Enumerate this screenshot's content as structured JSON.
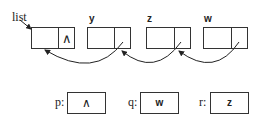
{
  "diagram": {
    "type": "linked-list",
    "head_label": "list",
    "nodes": [
      {
        "label": "list",
        "data": "",
        "next": "∧"
      },
      {
        "label": "y",
        "data": "",
        "next": "→list"
      },
      {
        "label": "z",
        "data": "",
        "next": "→y"
      },
      {
        "label": "w",
        "data": "",
        "next": "→z"
      }
    ],
    "variables": [
      {
        "name": "p:",
        "value": "∧"
      },
      {
        "name": "q:",
        "value": "w"
      },
      {
        "name": "r:",
        "value": "z"
      }
    ]
  }
}
